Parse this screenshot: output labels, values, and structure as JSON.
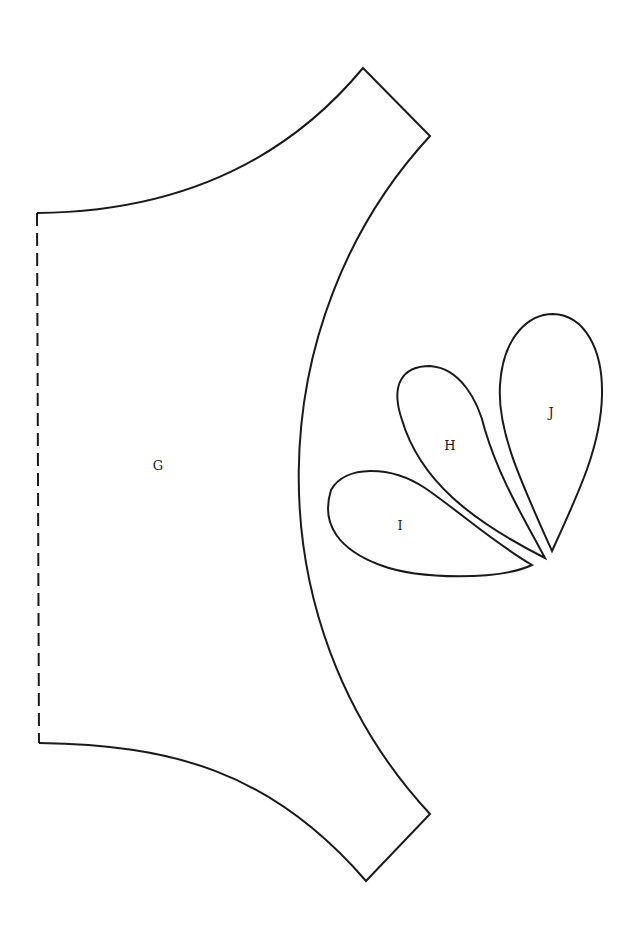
{
  "diagram": {
    "type": "sewing-pattern-pieces",
    "line_color": "#1a1a1a",
    "background": "#ffffff",
    "pieces": [
      {
        "id": "G",
        "label": "G",
        "shape": "curved body panel with dashed fold edge on left"
      },
      {
        "id": "H",
        "label": "H",
        "shape": "teardrop petal (lowest)"
      },
      {
        "id": "I",
        "label": "I",
        "shape": "teardrop petal (middle)"
      },
      {
        "id": "J",
        "label": "J",
        "shape": "teardrop petal (upright)"
      }
    ],
    "fold_line": "dashed"
  }
}
